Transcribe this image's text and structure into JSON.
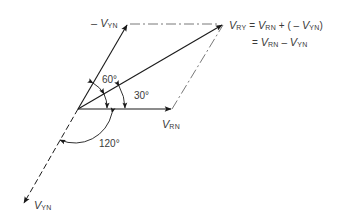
{
  "diagram": {
    "labels": {
      "neg_vyn": {
        "sign": "–",
        "symbol": "V",
        "sub": "YN"
      },
      "vry": {
        "symbol": "V",
        "sub": "RY"
      },
      "vrn": {
        "symbol": "V",
        "sub": "RN"
      },
      "vyn": {
        "symbol": "V",
        "sub": "YN"
      }
    },
    "equation": {
      "line1": {
        "lhs_symbol": "V",
        "lhs_sub": "RY",
        "eq": "=",
        "t1_symbol": "V",
        "t1_sub": "RN",
        "plus": "+ (",
        "neg": "–",
        "t2_symbol": "V",
        "t2_sub": "YN",
        "close": ")"
      },
      "line2": {
        "eq": "=",
        "t1_symbol": "V",
        "t1_sub": "RN",
        "minus": "–",
        "t2_symbol": "V",
        "t2_sub": "YN"
      }
    },
    "angles": {
      "a60": "60°",
      "a30": "30°",
      "a120": "120°"
    },
    "phasors": [
      {
        "name": "V_RN",
        "angle_deg": 0,
        "style": "solid"
      },
      {
        "name": "-V_YN",
        "angle_deg": 60,
        "style": "solid"
      },
      {
        "name": "V_RY",
        "angle_deg": 30,
        "style": "solid"
      },
      {
        "name": "V_YN",
        "angle_deg": 240,
        "style": "dashed"
      }
    ],
    "colors": {
      "line": "#2a2a2a",
      "text": "#3a3a3a",
      "background": "#ffffff"
    }
  }
}
